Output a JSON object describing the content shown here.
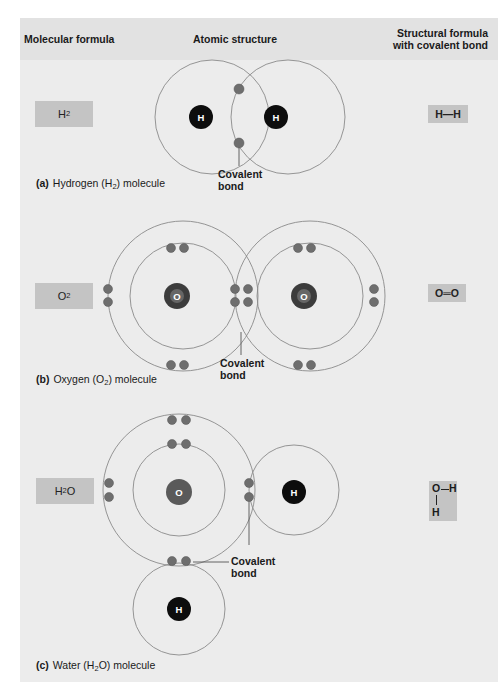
{
  "headers": {
    "molecular_formula": "Molecular formula",
    "atomic_structure": "Atomic structure",
    "structural_formula_line1": "Structural formula",
    "structural_formula_line2": "with covalent bond"
  },
  "colors": {
    "panel_bg": "#ececec",
    "header_bg": "#e2e2e2",
    "formula_box": "#c4c4c4",
    "orbit_line": "#8a8a8a",
    "electron": "#6e6e6e",
    "hydrogen_nucleus": "#0d0d0d",
    "oxygen_nucleus": "#5a5a5a"
  },
  "molecules": [
    {
      "id": "hydrogen",
      "letter": "(a)",
      "caption_pre": "Hydrogen (H",
      "caption_sub": "2",
      "caption_post": ") molecule",
      "formula_main": "H",
      "formula_sub": "2",
      "formula_post": "",
      "structural": "H—H",
      "bond_label_line1": "Covalent",
      "bond_label_line2": "bond",
      "atoms": [
        "H",
        "H"
      ]
    },
    {
      "id": "oxygen",
      "letter": "(b)",
      "caption_pre": "Oxygen (O",
      "caption_sub": "2",
      "caption_post": ") molecule",
      "formula_main": "O",
      "formula_sub": "2",
      "formula_post": "",
      "structural": "O═O",
      "bond_label_line1": "Covalent",
      "bond_label_line2": "bond",
      "atoms": [
        "O",
        "O"
      ]
    },
    {
      "id": "water",
      "letter": "(c)",
      "caption_pre": "Water (H",
      "caption_sub": "2",
      "caption_post": "O) molecule",
      "formula_main": "H",
      "formula_sub": "2",
      "formula_post": "O",
      "structural_top_left": "O",
      "structural_top_right": "H",
      "structural_bottom": "H",
      "bond_label_line1": "Covalent",
      "bond_label_line2": "bond",
      "atoms": [
        "O",
        "H",
        "H"
      ]
    }
  ]
}
